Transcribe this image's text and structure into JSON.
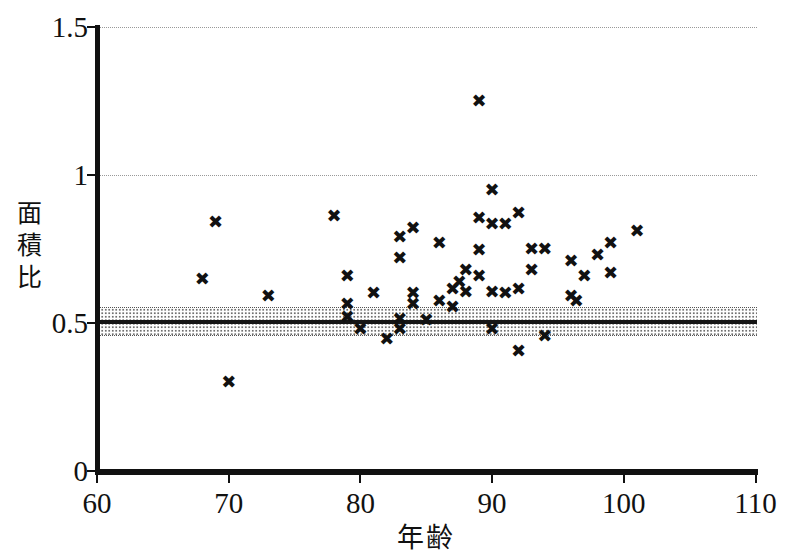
{
  "figure": {
    "background": "#ffffff",
    "marker_color": "#111111",
    "axis_color": "#111111",
    "grid_color": "#999999",
    "band_dot_color": "#6f6f6f",
    "reference_line_color": "#161616",
    "marker_glyph": "✖"
  },
  "chart_data": {
    "type": "scatter",
    "title": "",
    "xlabel": "年齢",
    "ylabel": "面積比",
    "xlim": [
      60,
      110
    ],
    "ylim": [
      0,
      1.5
    ],
    "xticks": [
      60,
      70,
      80,
      90,
      100,
      110
    ],
    "xtick_labels": [
      "60",
      "70",
      "80",
      "90",
      "100",
      "110"
    ],
    "yticks": [
      0,
      0.5,
      1,
      1.5
    ],
    "ytick_labels": [
      "0",
      "0.5",
      "1",
      "1.5"
    ],
    "gridlines_y": [
      1.0,
      1.5
    ],
    "grid_style": "dotted",
    "legend_position": "none",
    "marker": "x",
    "reference_line_y": 0.505,
    "reference_band_y": [
      0.455,
      0.555
    ],
    "points": [
      [
        68,
        0.65
      ],
      [
        69,
        0.84
      ],
      [
        70,
        0.3
      ],
      [
        73,
        0.59
      ],
      [
        78,
        0.86
      ],
      [
        79,
        0.66
      ],
      [
        79,
        0.565
      ],
      [
        79,
        0.52
      ],
      [
        80,
        0.48
      ],
      [
        81,
        0.6
      ],
      [
        82,
        0.445
      ],
      [
        83,
        0.79
      ],
      [
        83,
        0.72
      ],
      [
        83,
        0.515
      ],
      [
        83,
        0.48
      ],
      [
        84,
        0.82
      ],
      [
        84,
        0.6
      ],
      [
        84,
        0.565
      ],
      [
        85,
        0.51
      ],
      [
        86,
        0.77
      ],
      [
        86,
        0.575
      ],
      [
        87,
        0.555
      ],
      [
        87,
        0.615
      ],
      [
        87.5,
        0.64
      ],
      [
        88,
        0.605
      ],
      [
        88,
        0.68
      ],
      [
        89,
        1.25
      ],
      [
        89,
        0.855
      ],
      [
        89,
        0.745
      ],
      [
        89,
        0.66
      ],
      [
        90,
        0.95
      ],
      [
        90,
        0.835
      ],
      [
        90,
        0.605
      ],
      [
        90,
        0.48
      ],
      [
        91,
        0.835
      ],
      [
        91,
        0.6
      ],
      [
        92,
        0.87
      ],
      [
        92,
        0.615
      ],
      [
        92,
        0.405
      ],
      [
        93,
        0.75
      ],
      [
        93,
        0.68
      ],
      [
        94,
        0.75
      ],
      [
        94,
        0.455
      ],
      [
        96,
        0.71
      ],
      [
        96,
        0.59
      ],
      [
        96.4,
        0.575
      ],
      [
        97,
        0.66
      ],
      [
        98,
        0.73
      ],
      [
        99,
        0.77
      ],
      [
        99,
        0.67
      ],
      [
        101,
        0.81
      ]
    ]
  }
}
